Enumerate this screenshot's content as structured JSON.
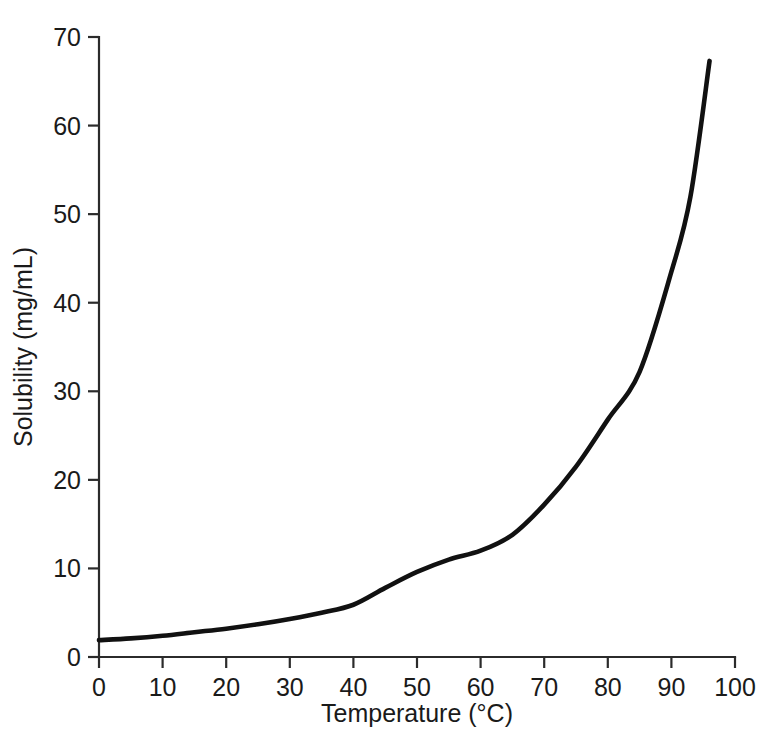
{
  "chart_data": {
    "type": "line",
    "title": "",
    "xlabel": "Temperature (°C)",
    "ylabel": "Solubility (mg/mL)",
    "xlim": [
      0,
      100
    ],
    "ylim": [
      0,
      70
    ],
    "grid": false,
    "legend": null,
    "xticks": [
      0,
      10,
      20,
      30,
      40,
      50,
      60,
      70,
      80,
      90,
      100
    ],
    "xtick_labels": [
      "0",
      "10",
      "20",
      "30",
      "40",
      "50",
      "60",
      "70",
      "80",
      "90",
      "100"
    ],
    "yticks": [
      0,
      10,
      20,
      30,
      40,
      50,
      60,
      70
    ],
    "ytick_labels": [
      "0",
      "10",
      "20",
      "30",
      "40",
      "50",
      "60",
      "70"
    ],
    "series": [
      {
        "name": "Solubility",
        "color": "#111111",
        "x": [
          0,
          5,
          10,
          15,
          20,
          25,
          30,
          35,
          40,
          45,
          50,
          55,
          60,
          65,
          70,
          75,
          80,
          85,
          90,
          93,
          96
        ],
        "y": [
          1.9,
          2.1,
          2.4,
          2.8,
          3.2,
          3.7,
          4.3,
          5.0,
          5.9,
          7.8,
          9.6,
          11.0,
          12.0,
          13.8,
          17.2,
          21.5,
          26.8,
          32.2,
          43.5,
          52.0,
          67.3
        ]
      }
    ],
    "annotations": []
  },
  "axes": {
    "x_axis_name": "x-axis",
    "y_axis_name": "y-axis"
  }
}
